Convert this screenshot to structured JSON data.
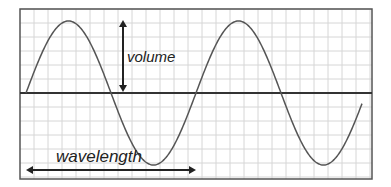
{
  "diagram": {
    "labels": {
      "volume": "volume",
      "wavelength": "wavelength"
    },
    "colors": {
      "grid": "#d6d6d6",
      "border": "#555555",
      "axis": "#333333",
      "wave": "#555555",
      "arrow": "#222222",
      "text": "#222222"
    },
    "frame": {
      "x": 20,
      "y": 9,
      "width": 352,
      "height": 170
    },
    "grid_spacing": 14,
    "axis_y": 93,
    "wave": {
      "start_x": 26,
      "end_x": 362,
      "wavelength_px": 170,
      "amplitude_px": 72
    },
    "volume_arrow": {
      "x": 123,
      "y1": 20,
      "y2": 92
    },
    "wavelength_arrow": {
      "y": 170,
      "x1": 26,
      "x2": 196
    }
  }
}
